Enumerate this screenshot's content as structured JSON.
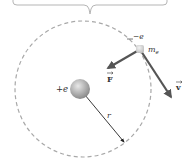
{
  "diagram": {
    "nucleus": {
      "label": "+e",
      "cx": 80,
      "cy": 89,
      "r": 10
    },
    "orbit": {
      "cx": 83,
      "cy": 89,
      "r": 68,
      "style": "dashed"
    },
    "electron": {
      "charge_label": "−e",
      "mass_label": "m",
      "mass_subscript": "e",
      "x": 140,
      "y": 49
    },
    "vectors": [
      {
        "name": "force",
        "label": "F",
        "from": [
          140,
          49
        ],
        "to": [
          106,
          69
        ],
        "color": "#555555"
      },
      {
        "name": "velocity",
        "label": "v",
        "from": [
          140,
          49
        ],
        "to": [
          173,
          100
        ],
        "color": "#555555"
      }
    ],
    "radius_line": {
      "label": "r",
      "from": [
        80,
        89
      ],
      "to": [
        125,
        143
      ]
    },
    "bracket": {
      "left": 13,
      "right": 167,
      "y": 4,
      "point_x": 90,
      "point_y": 14
    }
  },
  "colors": {
    "orbit": "#a8a8a8",
    "arrow": "#555555",
    "text": "#333333",
    "bracket": "#b5b5b5"
  }
}
